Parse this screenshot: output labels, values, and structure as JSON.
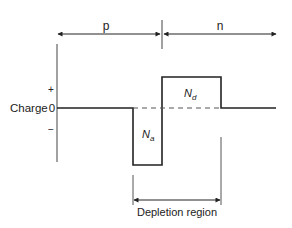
{
  "diagram": {
    "regions": {
      "p_label": "p",
      "n_label": "n"
    },
    "axis": {
      "label": "Charge",
      "zero_label": "0",
      "plus_label": "+",
      "minus_label": "−"
    },
    "charges": {
      "acceptor_label_base": "N",
      "acceptor_label_sub": "a",
      "donor_label_base": "N",
      "donor_label_sub": "d"
    },
    "depletion": {
      "label": "Depletion region"
    },
    "colors": {
      "line": "#222222",
      "dash": "#555555",
      "text": "#222222"
    }
  }
}
